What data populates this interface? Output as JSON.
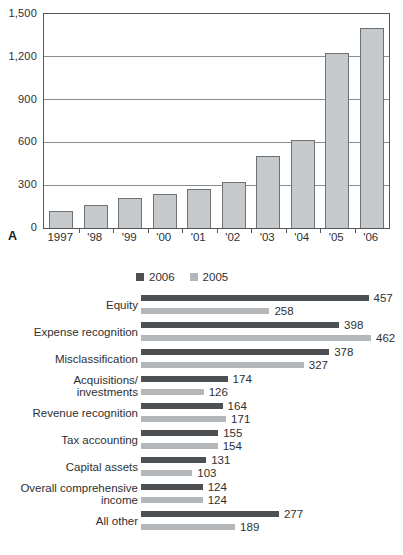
{
  "figure": {
    "panel_a_label": "A",
    "panel_b_label": "B"
  },
  "colors": {
    "background": "#ffffff",
    "text": "#2e3032",
    "axis": "#55585a",
    "grid": "#8a8d8f",
    "panel_a_bar_fill": "#c6c9cb",
    "panel_a_bar_border": "#6f7274",
    "series_2006": "#4d5052",
    "series_2005": "#b4b7b9"
  },
  "chart_data": [
    {
      "type": "bar",
      "panel": "A",
      "orientation": "vertical",
      "title": "",
      "xlabel": "",
      "ylabel": "",
      "categories": [
        "1997",
        "'98",
        "'99",
        "'00",
        "'01",
        "'02",
        "'03",
        "'04",
        "'05",
        "'06"
      ],
      "values": [
        120,
        160,
        210,
        235,
        270,
        325,
        505,
        620,
        1230,
        1400
      ],
      "ylim": [
        0,
        1500
      ],
      "yticks": [
        0,
        300,
        600,
        900,
        1200,
        1500
      ],
      "ytick_labels": [
        "0",
        "300",
        "600",
        "900",
        "1,200",
        "1,500"
      ],
      "grid": true,
      "legend_position": "none"
    },
    {
      "type": "bar",
      "panel": "B",
      "orientation": "horizontal",
      "title": "",
      "xlabel": "",
      "ylabel": "",
      "categories": [
        "Equity",
        "Expense recognition",
        "Misclassification",
        "Acquisitions/\ninvestments",
        "Revenue recognition",
        "Tax accounting",
        "Capital assets",
        "Overall comprehensive\nincome",
        "All other"
      ],
      "series": [
        {
          "name": "2006",
          "values": [
            457,
            398,
            378,
            174,
            164,
            155,
            131,
            124,
            277
          ]
        },
        {
          "name": "2005",
          "values": [
            258,
            462,
            327,
            126,
            171,
            154,
            103,
            124,
            189
          ]
        }
      ],
      "xmax": 462,
      "value_labels": true,
      "grid": false,
      "legend_position": "top"
    }
  ]
}
